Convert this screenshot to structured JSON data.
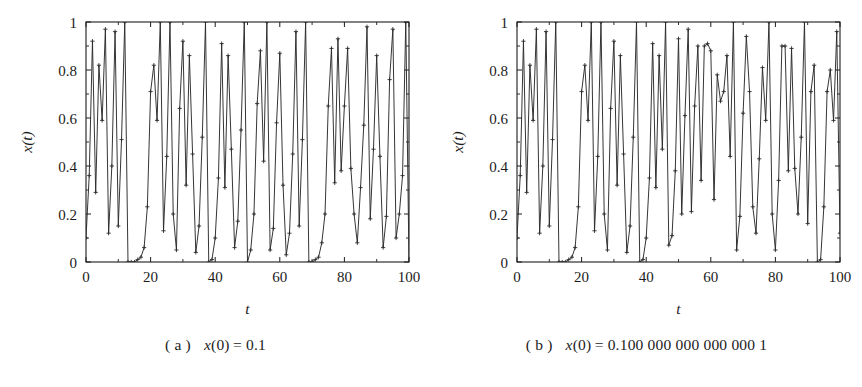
{
  "figure": {
    "background": "#ffffff",
    "ink": "#1c1c1c",
    "line_color": "#2a2a2a"
  },
  "panels": [
    {
      "id": "a",
      "caption_label": "( a )",
      "caption_var": "x",
      "caption_arg": "(0)",
      "caption_eq": "= 0.1",
      "axes": {
        "xlabel": "t",
        "ylabel": "x(t)",
        "xticks": [
          "0",
          "20",
          "40",
          "60",
          "80",
          "100"
        ],
        "yticks": [
          "0",
          "0.2",
          "0.4",
          "0.6",
          "0.8",
          "1"
        ]
      }
    },
    {
      "id": "b",
      "caption_label": "( b )",
      "caption_var": "x",
      "caption_arg": "(0)",
      "caption_eq": "= 0.100 000 000 000 000 1",
      "axes": {
        "xlabel": "t",
        "ylabel": "x(t)",
        "xticks": [
          "0",
          "20",
          "40",
          "60",
          "80",
          "100"
        ],
        "yticks": [
          "0",
          "0.2",
          "0.4",
          "0.6",
          "0.8",
          "1"
        ]
      }
    }
  ],
  "chart_data": [
    {
      "type": "line",
      "title": "",
      "subtitle": "",
      "xlabel": "t",
      "ylabel": "x(t)",
      "xlim": [
        0,
        100
      ],
      "ylim": [
        0,
        1
      ],
      "xticks": [
        0,
        20,
        40,
        60,
        80,
        100
      ],
      "yticks": [
        0,
        0.2,
        0.4,
        0.6,
        0.8,
        1
      ],
      "grid": false,
      "legend": false,
      "marker": "plus",
      "series": [
        {
          "name": "x(0) = 0.1",
          "x": [
            0,
            1,
            2,
            3,
            4,
            5,
            6,
            7,
            8,
            9,
            10,
            11,
            12,
            13,
            14,
            15,
            16,
            17,
            18,
            19,
            20,
            21,
            22,
            23,
            24,
            25,
            26,
            27,
            28,
            29,
            30,
            31,
            32,
            33,
            34,
            35,
            36,
            37,
            38,
            39,
            40,
            41,
            42,
            43,
            44,
            45,
            46,
            47,
            48,
            49,
            50,
            51,
            52,
            53,
            54,
            55,
            56,
            57,
            58,
            59,
            60,
            61,
            62,
            63,
            64,
            65,
            66,
            67,
            68,
            69,
            70,
            71,
            72,
            73,
            74,
            75,
            76,
            77,
            78,
            79,
            80,
            81,
            82,
            83,
            84,
            85,
            86,
            87,
            88,
            89,
            90,
            91,
            92,
            93,
            94,
            95,
            96,
            97,
            98,
            99,
            100
          ],
          "values": [
            0.1,
            0.36,
            0.92,
            0.29,
            0.82,
            0.59,
            0.97,
            0.12,
            0.4,
            0.96,
            0.15,
            0.51,
            1.0,
            0.0,
            0.0,
            0.0,
            0.01,
            0.02,
            0.06,
            0.23,
            0.71,
            0.82,
            0.59,
            1.0,
            0.13,
            0.44,
            1.0,
            0.2,
            0.05,
            0.64,
            0.92,
            0.32,
            0.86,
            0.45,
            0.04,
            0.15,
            0.52,
            1.0,
            0.0,
            0.01,
            0.1,
            0.35,
            0.91,
            0.31,
            0.86,
            0.47,
            0.06,
            0.17,
            0.55,
            1.0,
            0.0,
            0.05,
            0.2,
            0.66,
            0.88,
            0.42,
            1.0,
            0.05,
            0.14,
            0.58,
            0.87,
            0.32,
            0.03,
            0.12,
            0.45,
            0.96,
            0.15,
            0.51,
            1.0,
            0.0,
            0.0,
            0.01,
            0.02,
            0.08,
            0.2,
            0.65,
            0.89,
            0.33,
            0.93,
            0.38,
            0.65,
            0.89,
            0.39,
            0.2,
            0.08,
            0.31,
            0.57,
            0.98,
            0.18,
            0.47,
            0.86,
            0.44,
            0.06,
            0.19,
            0.76,
            0.97,
            0.1,
            0.2,
            0.36,
            1.0,
            0.0
          ]
        }
      ]
    },
    {
      "type": "line",
      "title": "",
      "subtitle": "",
      "xlabel": "t",
      "ylabel": "x(t)",
      "xlim": [
        0,
        100
      ],
      "ylim": [
        0,
        1
      ],
      "xticks": [
        0,
        20,
        40,
        60,
        80,
        100
      ],
      "yticks": [
        0,
        0.2,
        0.4,
        0.6,
        0.8,
        1
      ],
      "grid": false,
      "legend": false,
      "marker": "plus",
      "series": [
        {
          "name": "x(0) = 0.100 000 000 000 000 1",
          "x": [
            0,
            1,
            2,
            3,
            4,
            5,
            6,
            7,
            8,
            9,
            10,
            11,
            12,
            13,
            14,
            15,
            16,
            17,
            18,
            19,
            20,
            21,
            22,
            23,
            24,
            25,
            26,
            27,
            28,
            29,
            30,
            31,
            32,
            33,
            34,
            35,
            36,
            37,
            38,
            39,
            40,
            41,
            42,
            43,
            44,
            45,
            46,
            47,
            48,
            49,
            50,
            51,
            52,
            53,
            54,
            55,
            56,
            57,
            58,
            59,
            60,
            61,
            62,
            63,
            64,
            65,
            66,
            67,
            68,
            69,
            70,
            71,
            72,
            73,
            74,
            75,
            76,
            77,
            78,
            79,
            80,
            81,
            82,
            83,
            84,
            85,
            86,
            87,
            88,
            89,
            90,
            91,
            92,
            93,
            94,
            95,
            96,
            97,
            98,
            99,
            100
          ],
          "values": [
            0.1,
            0.36,
            0.92,
            0.29,
            0.82,
            0.59,
            0.97,
            0.12,
            0.4,
            0.96,
            0.15,
            0.51,
            1.0,
            0.0,
            0.0,
            0.0,
            0.01,
            0.02,
            0.06,
            0.23,
            0.71,
            0.82,
            0.59,
            1.0,
            0.13,
            0.44,
            1.0,
            0.2,
            0.05,
            0.64,
            0.92,
            0.32,
            0.86,
            0.45,
            0.04,
            0.15,
            0.52,
            1.0,
            0.0,
            0.01,
            0.1,
            0.35,
            0.91,
            0.31,
            0.86,
            0.47,
            1.0,
            0.07,
            0.11,
            0.38,
            0.93,
            0.2,
            0.61,
            0.97,
            0.21,
            0.65,
            0.9,
            0.34,
            0.9,
            0.91,
            0.88,
            0.26,
            0.78,
            0.67,
            0.71,
            0.86,
            0.44,
            1.0,
            0.05,
            0.19,
            0.62,
            0.94,
            0.71,
            0.23,
            0.12,
            0.43,
            0.81,
            0.59,
            1.0,
            0.2,
            0.05,
            0.34,
            0.9,
            0.9,
            0.38,
            0.89,
            0.39,
            0.2,
            0.52,
            1.0,
            0.16,
            0.71,
            0.82,
            0.0,
            0.01,
            0.23,
            0.71,
            0.8,
            0.59,
            0.96,
            0.12
          ]
        }
      ]
    }
  ]
}
